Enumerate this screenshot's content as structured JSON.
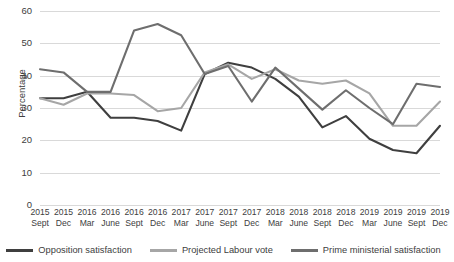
{
  "chart_data": {
    "type": "line",
    "title": "",
    "xlabel": "",
    "ylabel": "Percentage",
    "ylim": [
      0,
      60
    ],
    "ytick_step": 10,
    "yticks": [
      60,
      50,
      40,
      30,
      20,
      10,
      0
    ],
    "grid": true,
    "legend_position": "bottom",
    "categories": [
      "2015 Sept",
      "2015 Dec",
      "2016 Mar",
      "2016 June",
      "2016 Sept",
      "2016 Dec",
      "2017 Mar",
      "2017 June",
      "2017 Sept",
      "2017 Dec",
      "2018 Mar",
      "2018 June",
      "2018 Sept",
      "2018 Dec",
      "2019 Mar",
      "2019 June",
      "2019 Sept",
      "2019 Dec"
    ],
    "category_years": [
      "2015",
      "2015",
      "2016",
      "2016",
      "2016",
      "2016",
      "2017",
      "2017",
      "2017",
      "2017",
      "2018",
      "2018",
      "2018",
      "2018",
      "2019",
      "2019",
      "2019",
      "2019"
    ],
    "category_months": [
      "Sept",
      "Dec",
      "Mar",
      "June",
      "Sept",
      "Dec",
      "Mar",
      "June",
      "Sept",
      "Dec",
      "Mar",
      "June",
      "Sept",
      "Dec",
      "Mar",
      "June",
      "Sept",
      "Dec"
    ],
    "series": [
      {
        "name": "Opposition satisfaction",
        "color": "#3f3f3f",
        "values": [
          33.0,
          33.0,
          35.0,
          27.0,
          27.0,
          26.0,
          23.0,
          40.5,
          44.0,
          42.5,
          39.0,
          33.5,
          24.0,
          27.5,
          20.5,
          17.0,
          16.0,
          24.5
        ]
      },
      {
        "name": "Projected Labour vote",
        "color": "#a6a6a6",
        "values": [
          33.0,
          31.0,
          34.5,
          34.5,
          34.0,
          29.0,
          30.0,
          41.0,
          43.5,
          39.0,
          42.0,
          38.5,
          37.5,
          38.5,
          34.5,
          24.5,
          24.5,
          32.0
        ]
      },
      {
        "name": "Prime ministerial satisfaction",
        "color": "#6e6e6e",
        "values": [
          42.0,
          41.0,
          35.0,
          35.0,
          54.0,
          56.0,
          52.5,
          40.5,
          43.0,
          32.0,
          42.5,
          36.0,
          29.5,
          35.5,
          30.0,
          25.0,
          37.5,
          36.5
        ]
      }
    ]
  },
  "axis": {
    "y_title": "Percentage"
  }
}
